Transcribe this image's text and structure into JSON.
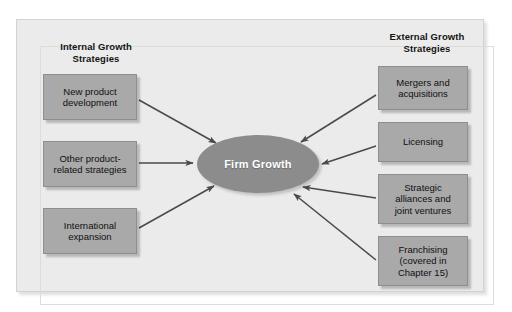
{
  "diagram": {
    "hub": {
      "label": "Firm Growth",
      "fill_color": "#8c8c8c",
      "text_color": "#ffffff"
    },
    "box_fill_color": "#a9a9a9",
    "panel_background_color": "#ebebeb",
    "arrow_color": "#4a4a4a",
    "columns": [
      {
        "id": "internal",
        "heading": "Internal Growth\nStrategies",
        "side": "left",
        "nodes": [
          {
            "id": "new-product",
            "label": "New product\ndevelopment"
          },
          {
            "id": "other-product",
            "label": "Other product-\nrelated strategies"
          },
          {
            "id": "international",
            "label": "International\nexpansion"
          }
        ]
      },
      {
        "id": "external",
        "heading": "External Growth\nStrategies",
        "side": "right",
        "nodes": [
          {
            "id": "mergers",
            "label": "Mergers and\nacquisitions"
          },
          {
            "id": "licensing",
            "label": "Licensing"
          },
          {
            "id": "alliances",
            "label": "Strategic\nalliances and\njoint ventures"
          },
          {
            "id": "franchising",
            "label": "Franchising\n(covered in\nChapter 15)"
          }
        ]
      }
    ]
  }
}
